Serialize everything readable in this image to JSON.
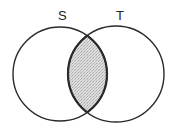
{
  "diagram": {
    "type": "venn",
    "sets": [
      {
        "label": "S",
        "cx": 60,
        "cy": 74,
        "r": 47
      },
      {
        "label": "T",
        "cx": 116,
        "cy": 74,
        "r": 48
      }
    ],
    "shaded_region": "S ∩ T",
    "colors": {
      "stroke": "#2a2a2a",
      "fill_intersection": "#cfcfcf",
      "background": "#ffffff"
    }
  }
}
